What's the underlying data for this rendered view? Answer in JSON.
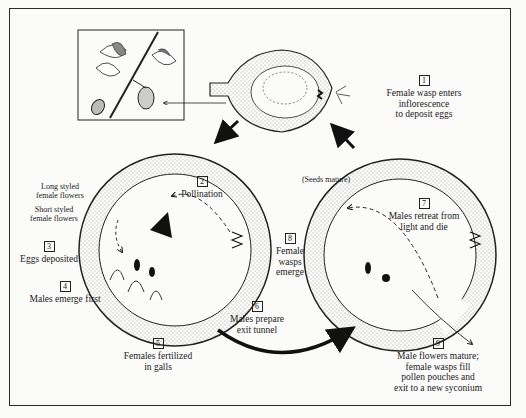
{
  "figure": {
    "stages": [
      {
        "number": "1",
        "text": "Female wasp enters inflorescence to deposit eggs",
        "lines": [
          "Female wasp enters",
          "inflorescence",
          "to deposit eggs"
        ]
      },
      {
        "number": "2",
        "text": "Pollination",
        "lines": [
          "Pollination"
        ]
      },
      {
        "number": "3",
        "text": "Eggs deposited",
        "lines": [
          "Eggs deposited"
        ]
      },
      {
        "number": "4",
        "text": "Males emerge first",
        "lines": [
          "Males emerge first"
        ]
      },
      {
        "number": "5",
        "text": "Females fertilized in galls",
        "lines": [
          "Females fertilized",
          "in galls"
        ]
      },
      {
        "number": "6",
        "text": "Males prepare exit tunnel",
        "lines": [
          "Males prepare",
          "exit tunnel"
        ]
      },
      {
        "number": "7",
        "text": "Males retreat from light and die",
        "lines": [
          "Males retreat from",
          "light and die"
        ]
      },
      {
        "number": "8",
        "text": "Female wasps emerge",
        "lines": [
          "Female",
          "wasps",
          "emerge"
        ]
      },
      {
        "number": "9",
        "text": "Male flowers mature; female wasps fill pollen pouches and exit to a new syconium",
        "lines": [
          "Male flowers mature;",
          "female wasps fill",
          "pollen pouches and",
          "exit to a new syconium"
        ]
      }
    ],
    "annotations": {
      "long_styled": [
        "Long styled",
        "female flowers"
      ],
      "short_styled": [
        "Short styled",
        "female flowers"
      ],
      "seeds_mature": "(Seeds mature)"
    },
    "colors": {
      "ink": "#1a1a1a",
      "paper": "#fbfbf9",
      "stipple": "#e2e2dc"
    }
  }
}
